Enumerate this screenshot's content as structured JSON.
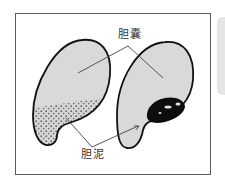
{
  "figure": {
    "labels": {
      "gallbladder": "胆囊",
      "sludge": "胆泥"
    },
    "colors": {
      "frame_border": "#5a5a5a",
      "organ_fill": "#d9d9d9",
      "organ_outline": "#111111",
      "sludge_dots": "#333333",
      "stone_fill": "#0d0d0d",
      "leader_lines": "#444444",
      "side_shadow": "#e6e6e6"
    },
    "panels": [
      {
        "name": "left-gallbladder",
        "content": "dispersed sludge particles in lower portion"
      },
      {
        "name": "right-gallbladder",
        "content": "dense black sludge mass near neck"
      }
    ]
  }
}
